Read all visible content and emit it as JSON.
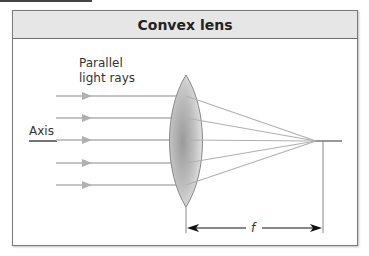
{
  "figure": {
    "title": "Convex lens",
    "labels": {
      "rays_line1": "Parallel",
      "rays_line2": "light rays",
      "axis": "Axis",
      "focal_length": "f"
    },
    "rays_y": [
      96,
      118,
      140,
      163,
      185
    ],
    "focal_point": {
      "x": 316,
      "y": 141
    },
    "colors": {
      "header_bg": "#e6e6e6",
      "ray": "#b0b0b0",
      "lens_fill": "#b8b8b8",
      "axis_dark": "#444444",
      "arrow": "#111111"
    }
  }
}
